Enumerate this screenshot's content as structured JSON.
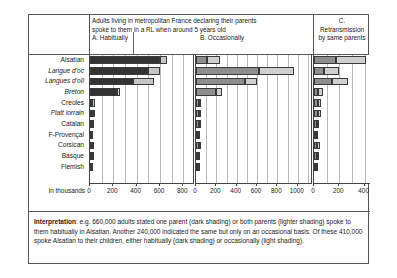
{
  "header": {
    "ab_title_line1": "Adults living in metropolitan France declaring their parents",
    "ab_title_line2": "spoke to them in a RL when around 5 years old",
    "panel_a_label": "A. Habitually",
    "panel_b_label": "B. Occasionally",
    "panel_c_label_line1": "C.",
    "panel_c_label_line2": "Retransmission",
    "panel_c_label_line3": "by same parents"
  },
  "axis_unit_label": "In thousands",
  "interpretation": {
    "prefix": "Interpretation",
    "body": ": e.g. 660,000 adults stated one parent (dark shading) or both parents (lighter shading) spoke to them habitually in Alsatian. Another 240,000 indicated the same but only on an occasional basis. Of these 410,000 spoke Alsatian to their children, either habitually (dark shading) or occasionally (light shading)."
  },
  "colors": {
    "dark_shading": "#333333",
    "light_shading": "#c6c6c6",
    "medium_shading": "#8e8e8e",
    "medium_light_shading": "#cfcfcf",
    "gridline": "#b9b9b9",
    "frame": "#555555"
  },
  "chart_data": {
    "type": "bar",
    "title": "Adults living in metropolitan France declaring their parents spoke to them in a RL when around 5 years old",
    "ylabel": "",
    "xlabel": "In thousands",
    "grid": true,
    "legend_position": "none",
    "orientation": "horizontal",
    "stacked": true,
    "categories": [
      "Alsatian",
      "Langue d'oc",
      "Langues d'oïl",
      "Breton",
      "Creoles",
      "Platt lorrain",
      "Catalan",
      "F-Provençal",
      "Corsican",
      "Basque",
      "Flemish"
    ],
    "categories_italic": [
      false,
      true,
      true,
      true,
      false,
      true,
      false,
      false,
      false,
      false,
      false
    ],
    "panels": [
      {
        "id": "A",
        "label": "A. Habitually",
        "xlim": [
          0,
          900
        ],
        "ticks": [
          0,
          200,
          400,
          600,
          800
        ],
        "series": [
          {
            "name": "one parent (dark shading)",
            "shade": "dark",
            "values": [
              600,
              500,
              370,
              230,
              20,
              25,
              15,
              12,
              18,
              14,
              10
            ]
          },
          {
            "name": "both parents (lighter shading)",
            "shade": "light",
            "values": [
              60,
              100,
              180,
              30,
              20,
              20,
              18,
              15,
              15,
              12,
              10
            ]
          }
        ],
        "totals": [
          660,
          600,
          550,
          260,
          40,
          45,
          33,
          27,
          33,
          26,
          20
        ]
      },
      {
        "id": "B",
        "label": "B. Occasionally",
        "xlim": [
          0,
          1150
        ],
        "ticks": [
          0,
          200,
          400,
          600,
          800,
          1000
        ],
        "series": [
          {
            "name": "one parent (dark shading)",
            "shade": "medium",
            "values": [
              110,
              620,
              480,
              200,
              30,
              30,
              25,
              22,
              25,
              20,
              18
            ]
          },
          {
            "name": "both parents (lighter shading)",
            "shade": "medium_light",
            "values": [
              130,
              340,
              120,
              60,
              20,
              18,
              16,
              14,
              16,
              14,
              12
            ]
          }
        ],
        "totals": [
          240,
          960,
          600,
          260,
          50,
          48,
          41,
          36,
          41,
          34,
          30
        ]
      },
      {
        "id": "C",
        "label": "C. Retransmission by same parents",
        "xlim": [
          0,
          450
        ],
        "ticks": [
          0,
          200,
          400
        ],
        "series": [
          {
            "name": "habitually (dark shading)",
            "shade": "medium",
            "values": [
              170,
              80,
              140,
              35,
              30,
              28,
              22,
              18,
              25,
              22,
              12
            ]
          },
          {
            "name": "occasionally (light shading)",
            "shade": "medium_light",
            "values": [
              240,
              120,
              130,
              35,
              28,
              26,
              20,
              16,
              22,
              18,
              10
            ]
          }
        ],
        "totals": [
          410,
          200,
          270,
          70,
          58,
          54,
          42,
          34,
          47,
          40,
          22
        ]
      }
    ]
  }
}
